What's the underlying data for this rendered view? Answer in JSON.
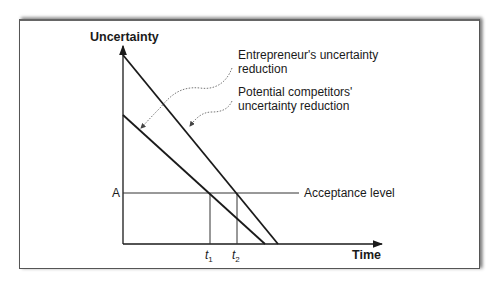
{
  "diagram": {
    "y_axis_label": "Uncertainty",
    "x_axis_label": "Time",
    "y_tick_label": "A",
    "x_ticks": [
      {
        "base": "t",
        "sub": "1"
      },
      {
        "base": "t",
        "sub": "2"
      }
    ],
    "annotations": {
      "entrepreneur_line1": "Entrepreneur's uncertainty",
      "entrepreneur_line2": "reduction",
      "competitors_line1": "Potential competitors'",
      "competitors_line2": "uncertainty reduction",
      "acceptance": "Acceptance level"
    },
    "series": [
      {
        "name": "Entrepreneur's uncertainty reduction",
        "start": [
          123,
          55
        ],
        "end": [
          278,
          244
        ]
      },
      {
        "name": "Potential competitors' uncertainty reduction",
        "start": [
          123,
          115
        ],
        "end": [
          265,
          244
        ]
      }
    ],
    "acceptance_level_y": 193,
    "colors": {
      "line": "#1a1a1a",
      "frame": "#555555",
      "dotted": "#666666"
    }
  }
}
